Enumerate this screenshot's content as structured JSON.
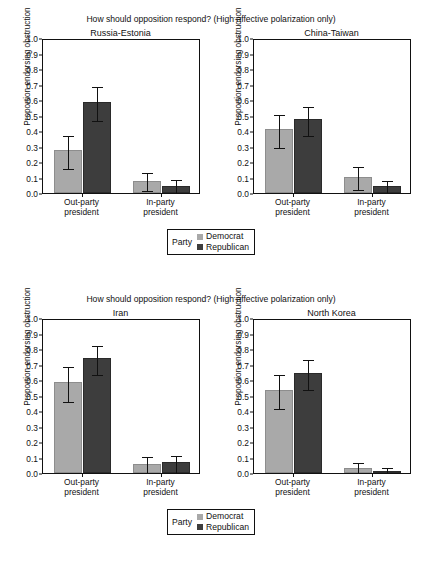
{
  "figure": {
    "top_partial_text": "",
    "supertitle": "How should opposition respond? (High affective polarization only)",
    "y_axis_label": "Proportion endorsing obstruction",
    "y_ticks": [
      "0.0",
      "0.1",
      "0.2",
      "0.3",
      "0.4",
      "0.5",
      "0.6",
      "0.7",
      "0.8",
      "0.9",
      "1.0"
    ],
    "x_tick_labels": [
      "Out-party\npresident",
      "In-party\npresident"
    ],
    "legend": {
      "title": "Party",
      "entries": [
        {
          "label": "Democrat",
          "color": "#a9a9a9"
        },
        {
          "label": "Republican",
          "color": "#3d3d3d"
        }
      ]
    }
  },
  "chart_data": [
    {
      "type": "bar",
      "title": "Russia-Estonia",
      "supertitle": "How should opposition respond? (High affective polarization only)",
      "xlabel": "",
      "ylabel": "Proportion endorsing obstruction",
      "ylim": [
        0.0,
        1.0
      ],
      "ytick_step": 0.1,
      "grid": false,
      "legend_position": "bottom-center",
      "categories": [
        "Out-party president",
        "In-party president"
      ],
      "series": [
        {
          "name": "Democrat",
          "color": "#a9a9a9",
          "values": [
            0.275,
            0.08
          ],
          "err_low": [
            0.17,
            0.025
          ],
          "err_high": [
            0.38,
            0.145
          ]
        },
        {
          "name": "Republican",
          "color": "#3d3d3d",
          "values": [
            0.585,
            0.045
          ],
          "err_low": [
            0.475,
            0.005
          ],
          "err_high": [
            0.7,
            0.095
          ]
        }
      ]
    },
    {
      "type": "bar",
      "title": "China-Taiwan",
      "supertitle": "How should opposition respond? (High affective polarization only)",
      "xlabel": "",
      "ylabel": "Proportion endorsing obstruction",
      "ylim": [
        0.0,
        1.0
      ],
      "ytick_step": 0.1,
      "grid": false,
      "legend_position": "bottom-center",
      "categories": [
        "Out-party president",
        "In-party president"
      ],
      "series": [
        {
          "name": "Democrat",
          "color": "#a9a9a9",
          "values": [
            0.41,
            0.105
          ],
          "err_low": [
            0.305,
            0.03
          ],
          "err_high": [
            0.515,
            0.18
          ]
        },
        {
          "name": "Republican",
          "color": "#3d3d3d",
          "values": [
            0.475,
            0.045
          ],
          "err_low": [
            0.38,
            0.005
          ],
          "err_high": [
            0.57,
            0.09
          ]
        }
      ]
    },
    {
      "type": "bar",
      "title": "Iran",
      "supertitle": "How should opposition respond? (High affective polarization only)",
      "xlabel": "",
      "ylabel": "Proportion endorsing obstruction",
      "ylim": [
        0.0,
        1.0
      ],
      "ytick_step": 0.1,
      "grid": false,
      "legend_position": "bottom-center",
      "categories": [
        "Out-party president",
        "In-party president"
      ],
      "series": [
        {
          "name": "Democrat",
          "color": "#a9a9a9",
          "values": [
            0.585,
            0.06
          ],
          "err_low": [
            0.47,
            0.01
          ],
          "err_high": [
            0.7,
            0.115
          ]
        },
        {
          "name": "Republican",
          "color": "#3d3d3d",
          "values": [
            0.74,
            0.07
          ],
          "err_low": [
            0.645,
            0.015
          ],
          "err_high": [
            0.835,
            0.125
          ]
        }
      ]
    },
    {
      "type": "bar",
      "title": "North Korea",
      "supertitle": "How should opposition respond? (High affective polarization only)",
      "xlabel": "",
      "ylabel": "Proportion endorsing obstruction",
      "ylim": [
        0.0,
        1.0
      ],
      "ytick_step": 0.1,
      "grid": false,
      "legend_position": "bottom-center",
      "categories": [
        "Out-party president",
        "In-party president"
      ],
      "series": [
        {
          "name": "Democrat",
          "color": "#a9a9a9",
          "values": [
            0.535,
            0.03
          ],
          "err_low": [
            0.425,
            0.0
          ],
          "err_high": [
            0.645,
            0.075
          ]
        },
        {
          "name": "Republican",
          "color": "#3d3d3d",
          "values": [
            0.645,
            0.01
          ],
          "err_low": [
            0.55,
            0.0
          ],
          "err_high": [
            0.74,
            0.045
          ]
        }
      ]
    }
  ]
}
